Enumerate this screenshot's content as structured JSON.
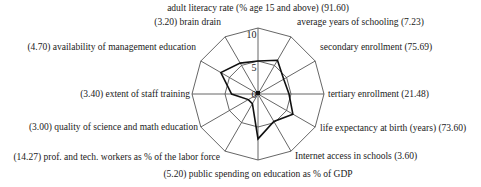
{
  "chart_data": {
    "type": "radar",
    "title": "",
    "scale": {
      "min": 0,
      "max": 10,
      "ticks": [
        "0",
        "5",
        "10"
      ]
    },
    "axes": [
      {
        "label": "adult literacy rate (% age 15 and above) (91.60)",
        "value": 5.0
      },
      {
        "label": "average years of schooling (7.23)",
        "value": 5.9
      },
      {
        "label": "secondary enrollment (75.69)",
        "value": 4.5
      },
      {
        "label": "tertiary enrollment (21.48)",
        "value": 4.7
      },
      {
        "label": "life expectancy at birth (years) (73.60)",
        "value": 6.1
      },
      {
        "label": "Internet access in schools (3.60)",
        "value": 4.8
      },
      {
        "label": "(5.20) public spending on education as % of GDP",
        "value": 6.8
      },
      {
        "label": "(14.27) prof. and tech. workers as % of the labor force",
        "value": 1.7
      },
      {
        "label": "(3.00) quality of science and math education",
        "value": 1.7
      },
      {
        "label": "(3.40) extent of staff training",
        "value": 4.0
      },
      {
        "label": "(4.70) availability of management education",
        "value": 6.5
      },
      {
        "label": "(3.20) brain drain",
        "value": 5.4
      }
    ],
    "grid": true,
    "legend": null
  }
}
